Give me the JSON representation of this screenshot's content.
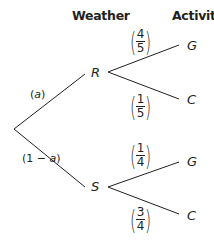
{
  "headers": {
    "weather": "Weather",
    "activity": "Activity"
  },
  "root": {},
  "nodes": {
    "r": "R",
    "s": "S",
    "g1": "G",
    "c1": "C",
    "g2": "G",
    "c2": "C"
  },
  "branches": {
    "root_r": {
      "label_open": "(",
      "label_var": "a",
      "label_close": ")"
    },
    "root_s": {
      "label_open": "(1 − ",
      "label_var": "a",
      "label_close": ")"
    },
    "r_g": {
      "num": "4",
      "den": "5"
    },
    "r_c": {
      "num": "1",
      "den": "5"
    },
    "s_g": {
      "num": "1",
      "den": "4"
    },
    "s_c": {
      "num": "3",
      "den": "4"
    }
  },
  "colors": {
    "line": "#231f20",
    "text": "#231f20",
    "background": "#ffffff"
  }
}
